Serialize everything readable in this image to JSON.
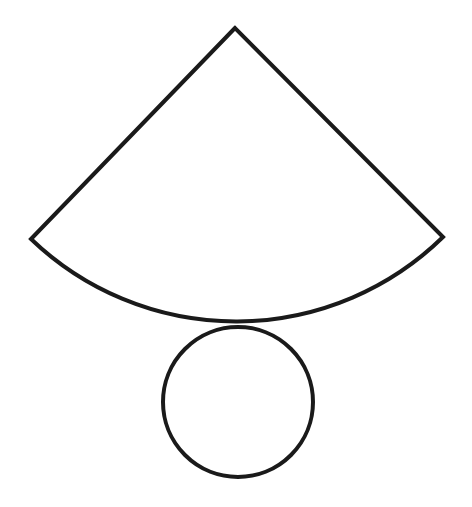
{
  "diagram": {
    "stroke_color": "#1a1a1a",
    "fill_color": "#ffffff",
    "background": "#ffffff",
    "sector": {
      "apex": [
        235,
        28
      ],
      "left_corner": [
        31,
        239
      ],
      "right_corner": [
        443,
        237
      ],
      "radius": 296
    },
    "circle": {
      "center": [
        238,
        402
      ],
      "radius": 75
    }
  }
}
